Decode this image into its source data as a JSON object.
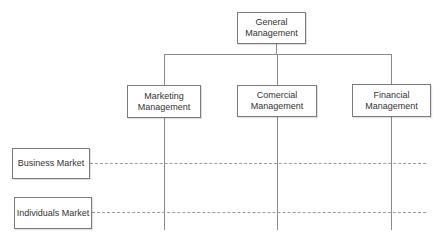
{
  "diagram": {
    "type": "matrix-org-chart",
    "root": {
      "label": "General Management"
    },
    "departments": [
      {
        "label": "Marketing Management"
      },
      {
        "label": "Comercial Management"
      },
      {
        "label": "Financial Management"
      }
    ],
    "markets": [
      {
        "label": "Business Market"
      },
      {
        "label": "Individuals Market"
      }
    ]
  }
}
